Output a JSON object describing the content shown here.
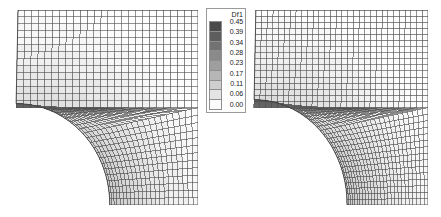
{
  "figure": {
    "background_color": "#ffffff",
    "width": 441,
    "height": 217
  },
  "legend": {
    "title": "Df1",
    "border_color": "#9a9a9a",
    "entries": [
      {
        "label": "0.45",
        "color": "#4a4a4a"
      },
      {
        "label": "0.39",
        "color": "#5e5e5e"
      },
      {
        "label": "0.34",
        "color": "#727272"
      },
      {
        "label": "0.28",
        "color": "#8a8a8a"
      },
      {
        "label": "0.23",
        "color": "#9e9e9e"
      },
      {
        "label": "0.17",
        "color": "#b6b6b6"
      },
      {
        "label": "0.11",
        "color": "#cecece"
      },
      {
        "label": "0.06",
        "color": "#e4e4e4"
      },
      {
        "label": "0.00",
        "color": "#fafafa"
      }
    ]
  },
  "chart_data": {
    "type": "heatmap",
    "title": "Df1",
    "xlabel": "",
    "ylabel": "",
    "legend_position": "center",
    "colormap": "grayscale-9-band",
    "colorbar_ticks": [
      0.45,
      0.39,
      0.34,
      0.28,
      0.23,
      0.17,
      0.11,
      0.06,
      0.0
    ],
    "colorbar_colors": [
      "#4a4a4a",
      "#5e5e5e",
      "#727272",
      "#8a8a8a",
      "#9e9e9e",
      "#b6b6b6",
      "#cecece",
      "#e4e4e4",
      "#fafafa"
    ],
    "vmin": 0.0,
    "vmax": 0.45,
    "panels": [
      {
        "name": "coarse-mesh",
        "position": "left",
        "description": "Quadrilateral finite element mesh of a square plate with a quarter-circular hole at the lower-left corner, shaded by Df1",
        "geometry": {
          "shape": "square-plate-with-quarter-circle-hole",
          "hole_corner": "bottom-left",
          "hole_radius_fraction": 0.52,
          "element_type": "quad4"
        },
        "mesh": {
          "radial_divisions": 22,
          "circumferential_divisions": 26,
          "upper_block_rows": 14,
          "upper_block_cols": 26
        },
        "field_range": [
          0.0,
          0.45
        ]
      },
      {
        "name": "fine-mesh",
        "position": "right",
        "description": "Refined quadrilateral finite element mesh of the same plate with a quarter-circular hole, shaded by Df1",
        "geometry": {
          "shape": "square-plate-with-quarter-circle-hole",
          "hole_corner": "bottom-left",
          "hole_radius_fraction": 0.54,
          "element_type": "quad4"
        },
        "mesh": {
          "radial_divisions": 26,
          "circumferential_divisions": 30,
          "upper_block_rows": 16,
          "upper_block_cols": 30
        },
        "field_range": [
          0.0,
          0.45
        ]
      }
    ]
  }
}
